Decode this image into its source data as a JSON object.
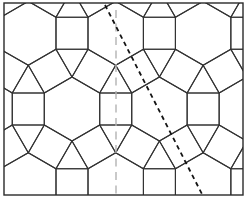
{
  "figure": {
    "background_color": "#ffffff",
    "canvas": {
      "width": 250,
      "height": 204
    },
    "border": {
      "x": 4,
      "y": 3,
      "width": 239,
      "height": 192,
      "color": "#2a2a2a",
      "stroke_width": 1.4
    },
    "tiling": {
      "type": "rhombitrihexagonal 3.4.6.4 (hexagons, squares, triangles)",
      "edge": 32,
      "hex_half_width": 27.71,
      "origin": {
        "x": 72,
        "y": 109
      },
      "lattice": {
        "a": {
          "x": 87.43,
          "y": 0
        },
        "b": {
          "x": 43.72,
          "y": 75.71
        }
      },
      "i_range": [
        -2,
        3
      ],
      "j_range": [
        -2,
        2
      ],
      "line_color": "#333333",
      "stroke_width": 1.1,
      "fill": "none"
    },
    "symmetry_lines": [
      {
        "id": "vertical-mirror-axis",
        "style": "long-dash",
        "x1": 116,
        "y1": 10,
        "x2": 116,
        "y2": 194,
        "color": "#b3b3b3",
        "stroke_width": 1.4,
        "dash": "8 5.5"
      },
      {
        "id": "diagonal-glide-axis",
        "style": "dotted",
        "x1": 105,
        "y1": 5,
        "x2": 204,
        "y2": 198,
        "color": "#141414",
        "stroke_width": 1.8,
        "dash": "4.5 3.8"
      }
    ]
  }
}
